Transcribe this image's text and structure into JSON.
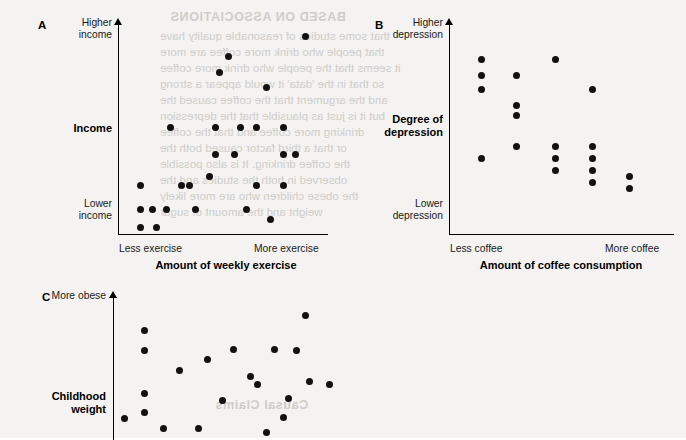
{
  "page": {
    "background_color": "#f4f3f1",
    "ink_color": "#111111",
    "bleed_text_color": "#c9c7c4"
  },
  "bleed_through": {
    "heading": "BASED ON ASSOCIATIONS",
    "lines": [
      "that some studies of reasonable quality have",
      "that people who drink more coffee are more",
      "it seems that the people who drink more coffee",
      "so that in the 'data' it would appear a strong",
      "and the argument that the coffee caused the",
      "but it is just as plausible that the depression",
      "drinking more coffee and that the coffee",
      "or that a third factor caused both the",
      "the coffee drinking. It is also possible",
      "observed in both the studies and the",
      "the obese children who are more likely",
      "weight and the amount of sugar"
    ],
    "footer": "Causal Claims"
  },
  "panels": [
    {
      "id": "A",
      "letter": "A",
      "y_axis": {
        "title": "Income",
        "high_label": "Higher\nincome",
        "low_label": "Lower\nincome"
      },
      "x_axis": {
        "title": "Amount of weekly exercise",
        "low_label": "Less exercise",
        "high_label": "More exercise"
      }
    },
    {
      "id": "B",
      "letter": "B",
      "y_axis": {
        "title": "Degree of\ndepression",
        "high_label": "Higher\ndepression",
        "low_label": "Lower\ndepression"
      },
      "x_axis": {
        "title": "Amount of coffee consumption",
        "low_label": "Less coffee",
        "high_label": "More coffee"
      }
    },
    {
      "id": "C",
      "letter": "C",
      "y_axis": {
        "title": "Childhood\nweight",
        "high_label": "More obese",
        "low_label": ""
      },
      "x_axis": {
        "title": "",
        "low_label": "",
        "high_label": ""
      }
    }
  ],
  "chart_data": [
    {
      "type": "scatter",
      "panel": "A",
      "title": "",
      "xlabel": "Amount of weekly exercise",
      "ylabel": "Income",
      "xtick_labels": [
        "Less exercise",
        "More exercise"
      ],
      "ytick_labels": [
        "Lower income",
        "Higher income"
      ],
      "xlim": [
        0,
        100
      ],
      "ylim": [
        0,
        100
      ],
      "grid": false,
      "legend": "none",
      "annotation": "Positive association: income rises with weekly exercise",
      "points": [
        {
          "x": 9,
          "y": 23
        },
        {
          "x": 9,
          "y": 11
        },
        {
          "x": 9,
          "y": 2
        },
        {
          "x": 15,
          "y": 11
        },
        {
          "x": 17,
          "y": 2
        },
        {
          "x": 22,
          "y": 11
        },
        {
          "x": 24,
          "y": 51
        },
        {
          "x": 29,
          "y": 23
        },
        {
          "x": 33,
          "y": 23
        },
        {
          "x": 36,
          "y": 11
        },
        {
          "x": 43,
          "y": 27
        },
        {
          "x": 46,
          "y": 51
        },
        {
          "x": 46,
          "y": 38
        },
        {
          "x": 48,
          "y": 78
        },
        {
          "x": 52,
          "y": 86
        },
        {
          "x": 55,
          "y": 38
        },
        {
          "x": 58,
          "y": 51
        },
        {
          "x": 61,
          "y": 11
        },
        {
          "x": 66,
          "y": 51
        },
        {
          "x": 66,
          "y": 23
        },
        {
          "x": 71,
          "y": 71
        },
        {
          "x": 73,
          "y": 6
        },
        {
          "x": 79,
          "y": 51
        },
        {
          "x": 79,
          "y": 38
        },
        {
          "x": 79,
          "y": 23
        },
        {
          "x": 85,
          "y": 38
        },
        {
          "x": 90,
          "y": 96
        }
      ]
    },
    {
      "type": "scatter",
      "panel": "B",
      "title": "",
      "xlabel": "Amount of coffee consumption",
      "ylabel": "Degree of depression",
      "xtick_labels": [
        "Less coffee",
        "More coffee"
      ],
      "ytick_labels": [
        "Lower depression",
        "Higher depression"
      ],
      "xlim": [
        0,
        100
      ],
      "ylim": [
        0,
        100
      ],
      "grid": false,
      "legend": "none",
      "annotation": "Negative association: depression falls as coffee consumption rises",
      "points": [
        {
          "x": 13,
          "y": 85
        },
        {
          "x": 13,
          "y": 77
        },
        {
          "x": 13,
          "y": 70
        },
        {
          "x": 13,
          "y": 35
        },
        {
          "x": 29,
          "y": 77
        },
        {
          "x": 29,
          "y": 62
        },
        {
          "x": 29,
          "y": 57
        },
        {
          "x": 29,
          "y": 41
        },
        {
          "x": 47,
          "y": 85
        },
        {
          "x": 47,
          "y": 41
        },
        {
          "x": 47,
          "y": 35
        },
        {
          "x": 47,
          "y": 29
        },
        {
          "x": 64,
          "y": 70
        },
        {
          "x": 64,
          "y": 41
        },
        {
          "x": 64,
          "y": 35
        },
        {
          "x": 64,
          "y": 29
        },
        {
          "x": 64,
          "y": 23
        },
        {
          "x": 81,
          "y": 26
        },
        {
          "x": 81,
          "y": 20
        }
      ]
    },
    {
      "type": "scatter",
      "panel": "C",
      "title": "",
      "xlabel": "",
      "ylabel": "Childhood weight",
      "xtick_labels": [],
      "ytick_labels": [
        "More obese"
      ],
      "xlim": [
        0,
        100
      ],
      "ylim": [
        0,
        100
      ],
      "grid": false,
      "legend": "none",
      "annotation": "Positive association (panel cropped at page edge)",
      "points": [
        {
          "x": 3,
          "y": 12
        },
        {
          "x": 12,
          "y": 78
        },
        {
          "x": 12,
          "y": 63
        },
        {
          "x": 12,
          "y": 31
        },
        {
          "x": 12,
          "y": 17
        },
        {
          "x": 21,
          "y": 5
        },
        {
          "x": 28,
          "y": 48
        },
        {
          "x": 37,
          "y": 5
        },
        {
          "x": 41,
          "y": 56
        },
        {
          "x": 48,
          "y": 26
        },
        {
          "x": 53,
          "y": 64
        },
        {
          "x": 61,
          "y": 44
        },
        {
          "x": 64,
          "y": 38
        },
        {
          "x": 68,
          "y": 2
        },
        {
          "x": 72,
          "y": 64
        },
        {
          "x": 76,
          "y": 13
        },
        {
          "x": 78,
          "y": 27
        },
        {
          "x": 82,
          "y": 63
        },
        {
          "x": 86,
          "y": 89
        },
        {
          "x": 88,
          "y": 40
        },
        {
          "x": 97,
          "y": 38
        }
      ]
    }
  ]
}
